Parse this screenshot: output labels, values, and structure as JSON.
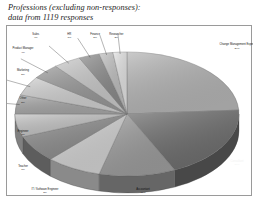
{
  "title": {
    "line1": "Professions (excluding non-responses):",
    "line2": "data from 1119 responses"
  },
  "chart_data": {
    "type": "pie",
    "title": "Professions (excluding non-responses): data from 1119 responses",
    "total_responses": 1119,
    "style": "3d-pie",
    "grid": false,
    "legend": "none",
    "labels_show_percent": true,
    "categories": [
      "Change Management Expert",
      "Consultant",
      "Accountant",
      "IT / Software Engineer",
      "Teacher",
      "Engineer",
      "Other",
      "Marketing",
      "Product Manager",
      "Sales",
      "HR",
      "Finance",
      "Researcher"
    ],
    "values": [
      24,
      19,
      11,
      8,
      7,
      6,
      5,
      5,
      4,
      4,
      3,
      2,
      2
    ],
    "slices": [
      {
        "label": "Change Management Expert",
        "percent": "24%",
        "value": 24,
        "color": "#b4b4b4",
        "label_fill": "dark"
      },
      {
        "label": "Consultant",
        "percent": "19%",
        "value": 19,
        "color": "#6e6e6e",
        "label_fill": "light"
      },
      {
        "label": "Accountant",
        "percent": "11%",
        "value": 11,
        "color": "#9c9c9c",
        "label_fill": "dark"
      },
      {
        "label": "IT / Software Engineer",
        "percent": "8%",
        "value": 8,
        "color": "#d2d2d2",
        "label_fill": "dark"
      },
      {
        "label": "Teacher",
        "percent": "7%",
        "value": 7,
        "color": "#8e8e8e",
        "label_fill": "dark"
      },
      {
        "label": "Engineer",
        "percent": "6%",
        "value": 6,
        "color": "#c2c2c2",
        "label_fill": "dark"
      },
      {
        "label": "Other",
        "percent": "5%",
        "value": 5,
        "color": "#a6a6a6",
        "label_fill": "dark"
      },
      {
        "label": "Marketing",
        "percent": "5%",
        "value": 5,
        "color": "#cfcfcf",
        "label_fill": "dark"
      },
      {
        "label": "Product Manager",
        "percent": "4%",
        "value": 4,
        "color": "#989898",
        "label_fill": "dark"
      },
      {
        "label": "Sales",
        "percent": "4%",
        "value": 4,
        "color": "#c8c8c8",
        "label_fill": "dark"
      },
      {
        "label": "HR",
        "percent": "3%",
        "value": 3,
        "color": "#8a8a8a",
        "label_fill": "dark"
      },
      {
        "label": "Finance",
        "percent": "2%",
        "value": 2,
        "color": "#bdbdbd",
        "label_fill": "dark"
      },
      {
        "label": "Researcher",
        "percent": "2%",
        "value": 2,
        "color": "#e2e2e2",
        "label_fill": "dark"
      }
    ],
    "colors": {
      "frame": "#9a9a9a",
      "background": "#ffffff",
      "text": "#101010",
      "rim_shadow": "#4a4a4a"
    }
  }
}
